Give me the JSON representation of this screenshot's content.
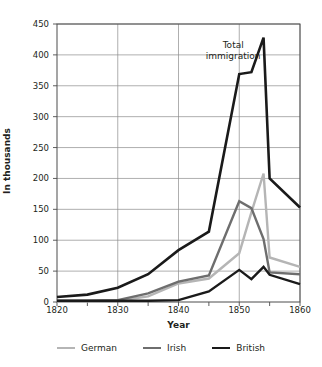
{
  "chart_data": {
    "type": "line",
    "title": "",
    "xlabel": "Year",
    "ylabel": "In thousands",
    "xlim": [
      1820,
      1860
    ],
    "ylim": [
      0,
      450
    ],
    "ytick_step": 50,
    "xtick_step": 10,
    "x_minor_step": 5,
    "grid": true,
    "legend_position": "bottom",
    "yticks": [
      "450",
      "400",
      "350",
      "300",
      "250",
      "200",
      "150",
      "100",
      "50",
      "0"
    ],
    "ytick_values": [
      450,
      400,
      350,
      300,
      250,
      200,
      150,
      100,
      50,
      0
    ],
    "xticks": [
      "1820",
      "1830",
      "1840",
      "1850",
      "1860"
    ],
    "xtick_values": [
      1820,
      1830,
      1840,
      1850,
      1860
    ],
    "x": [
      1820,
      1825,
      1830,
      1835,
      1840,
      1845,
      1850,
      1852,
      1854,
      1855,
      1860
    ],
    "series": [
      {
        "name": "Total immigration",
        "legend_name": "British",
        "color": "#1a1a1a",
        "width": 2.6,
        "values": [
          8,
          12,
          23,
          45,
          84,
          114,
          369,
          372,
          428,
          200,
          153
        ]
      },
      {
        "name": "German",
        "legend_name": "German",
        "color": "#b5b5b5",
        "width": 2.4,
        "values": [
          1,
          1,
          2,
          9,
          30,
          38,
          79,
          145,
          208,
          72,
          57
        ]
      },
      {
        "name": "Irish",
        "legend_name": "Irish",
        "color": "#6e6e6e",
        "width": 2.4,
        "values": [
          2,
          2,
          3,
          14,
          33,
          43,
          163,
          152,
          102,
          48,
          45
        ]
      },
      {
        "name": "British",
        "legend_name": "British",
        "color": "#1a1a1a",
        "width": 2.4,
        "values": [
          2,
          2,
          2,
          2,
          3,
          17,
          52,
          37,
          57,
          44,
          29
        ]
      }
    ],
    "legend": [
      {
        "label": "German",
        "color": "#b5b5b5"
      },
      {
        "label": "Irish",
        "color": "#6e6e6e"
      },
      {
        "label": "British",
        "color": "#1a1a1a"
      }
    ],
    "annotations": [
      {
        "text_line1": "Total",
        "text_line2": "immigration",
        "x": 1849,
        "y": 415
      }
    ]
  }
}
